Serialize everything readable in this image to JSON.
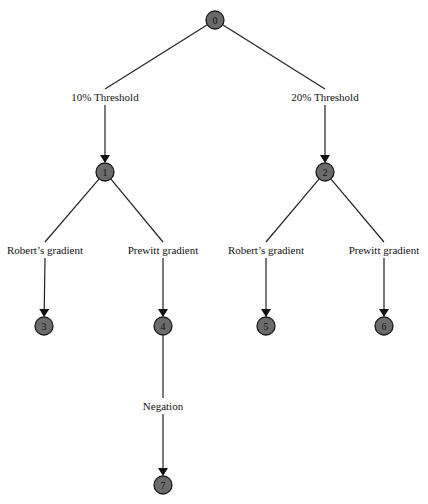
{
  "diagram": {
    "type": "tree",
    "colors": {
      "node_fill": "#6b6b6b",
      "node_stroke": "#1a1a1a",
      "edge": "#222222",
      "background": "#ffffff"
    },
    "nodes": [
      {
        "id": "0",
        "label": "0",
        "x": 215,
        "y": 20
      },
      {
        "id": "1",
        "label": "1",
        "x": 105,
        "y": 172
      },
      {
        "id": "2",
        "label": "2",
        "x": 325,
        "y": 172
      },
      {
        "id": "3",
        "label": "3",
        "x": 44,
        "y": 326
      },
      {
        "id": "4",
        "label": "4",
        "x": 163,
        "y": 326
      },
      {
        "id": "5",
        "label": "5",
        "x": 266,
        "y": 326
      },
      {
        "id": "6",
        "label": "6",
        "x": 384,
        "y": 326
      },
      {
        "id": "7",
        "label": "7",
        "x": 163,
        "y": 485
      }
    ],
    "edges": [
      {
        "from": "0",
        "to": "1",
        "label": "10% Threshold",
        "lx": 105,
        "ly": 97
      },
      {
        "from": "0",
        "to": "2",
        "label": "20% Threshold",
        "lx": 325,
        "ly": 97
      },
      {
        "from": "1",
        "to": "3",
        "label": "Robert’s gradient",
        "lx": 45,
        "ly": 250
      },
      {
        "from": "1",
        "to": "4",
        "label": "Prewitt gradient",
        "lx": 163,
        "ly": 250
      },
      {
        "from": "2",
        "to": "5",
        "label": "Robert’s gradient",
        "lx": 266,
        "ly": 250
      },
      {
        "from": "2",
        "to": "6",
        "label": "Prewitt gradient",
        "lx": 384,
        "ly": 250
      },
      {
        "from": "4",
        "to": "7",
        "label": "Negation",
        "lx": 163,
        "ly": 406
      }
    ]
  }
}
